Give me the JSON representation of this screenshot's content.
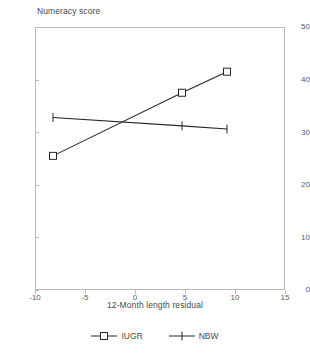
{
  "chart_data": {
    "type": "line",
    "title": "Numeracy score",
    "xlabel": "12-Month length residual",
    "ylabel": "",
    "xlim": [
      -10,
      15
    ],
    "ylim": [
      0,
      50
    ],
    "xticks": [
      -10,
      -5,
      0,
      5,
      10,
      15
    ],
    "yticks": [
      0,
      10,
      20,
      30,
      40,
      50
    ],
    "grid": false,
    "legend_position": "bottom-center",
    "series": [
      {
        "name": "IUGR",
        "marker": "square",
        "x": [
          -8.2,
          4.7,
          9.2
        ],
        "values": [
          25.5,
          37.5,
          41.5
        ]
      },
      {
        "name": "NBW",
        "marker": "plus",
        "x": [
          -8.2,
          4.7,
          9.2
        ],
        "values": [
          32.8,
          31.2,
          30.6
        ]
      }
    ]
  },
  "axis": {
    "x_tick_labels": [
      "-10",
      "-5",
      "0",
      "5",
      "10",
      "15"
    ],
    "y_tick_labels": [
      "0",
      "10",
      "20",
      "30",
      "40",
      "50"
    ]
  },
  "legend": {
    "items": [
      {
        "label": "IUGR"
      },
      {
        "label": "NBW"
      }
    ]
  },
  "colors": {
    "line": "#262626",
    "frame": "#b9b9b9",
    "text": "#4a4a4a"
  }
}
